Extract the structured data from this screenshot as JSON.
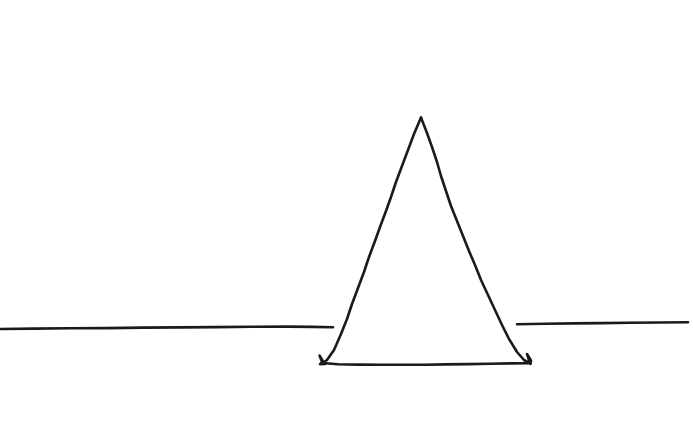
{
  "canvas": {
    "width": 693,
    "height": 442,
    "background_color": "#ffffff",
    "medium": "hand-drawn line art",
    "description": "A hand-drawn triangle sitting on a horizontal ground line"
  },
  "style": {
    "stroke_color": "#1a1a1a",
    "stroke_width": 2.6,
    "fill": "none",
    "line_cap": "round",
    "line_join": "round"
  },
  "shapes": {
    "horizon_line_left": {
      "label": "ground line left segment",
      "type": "polyline",
      "start": [
        0,
        329
      ],
      "end": [
        333,
        327
      ],
      "points": "0,329 34,328.6 70,328.3 106,328.1 143,327.6 180,327.4 216,327.1 252,326.8 288,326.6 312,326.9 333,327.2"
    },
    "horizon_line_right": {
      "label": "ground line right segment",
      "type": "polyline",
      "start": [
        517,
        324
      ],
      "end": [
        688,
        322
      ],
      "points": "517,324.3 545,323.8 574,323.4 602,323.1 630,322.8 659,322.5 688,322.2"
    },
    "triangle": {
      "label": "triangle",
      "type": "polygon",
      "apex": [
        421,
        117
      ],
      "bottom_left": [
        322,
        363
      ],
      "bottom_right": [
        530,
        363
      ],
      "base_width_px": 208,
      "height_px": 246,
      "left_edge_points": "421,117.5 414,134 408,150 402,166 396,182 391,197 386,211 380,227 375,241 369,257 364,272 358,288 352,304 347,319 341,334 334,350 327,360 322.5,363",
      "right_edge_points": "421,117.5 427,133 432,147 437,162 441,176 446,191 451,206 457,221 463,236 469,251 475,265 481,280 488,295 495,310 502,325 509,339 517,352 524,360 530,363.2",
      "base_points": "322.5,363 338,364.2 358,364.6 380,364.7 402,364.8 424,364.7 446,364.4 468,364.1 490,363.8 510,363.4 530,363.2",
      "corner_flourish_left": "322.5,363 319.5,355.5 323,361.5 320,364.2 325,364",
      "corner_flourish_right": "530,363.2 527,354 531,360.5 530.5,364"
    }
  }
}
